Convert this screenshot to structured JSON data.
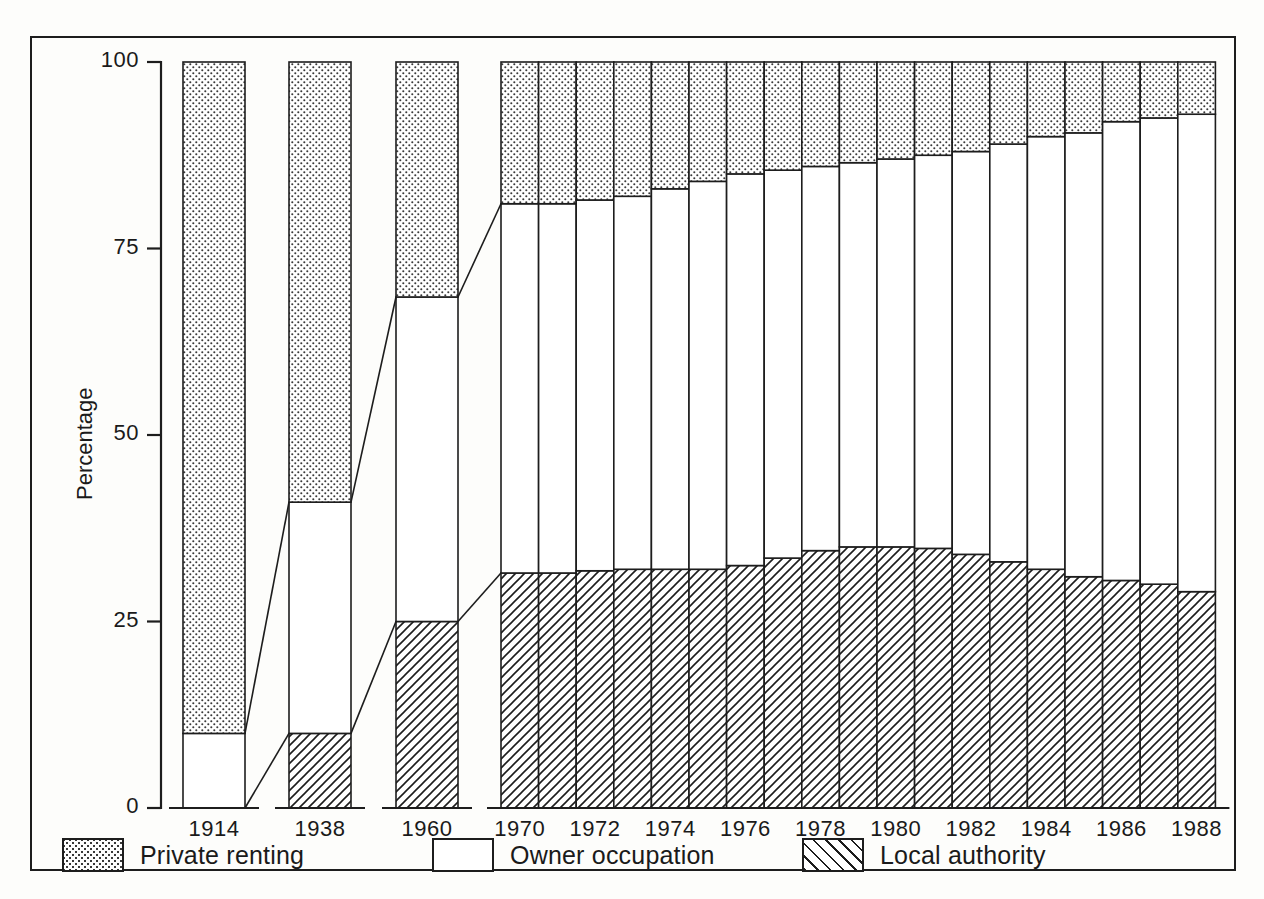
{
  "figure": {
    "frame": true,
    "top_bleed_text": "",
    "ylabel": "Percentage"
  },
  "axis": {
    "y_ticks": [
      "0",
      "25",
      "50",
      "75",
      "100"
    ],
    "x_tick_labels": [
      "1914",
      "1938",
      "1960",
      "1970",
      "1972",
      "1974",
      "1976",
      "1978",
      "1980",
      "1982",
      "1984",
      "1986",
      "1988"
    ]
  },
  "legend": {
    "items": [
      {
        "label": "Private renting",
        "pattern": "dots"
      },
      {
        "label": "Owner occupation",
        "pattern": "plain"
      },
      {
        "label": "Local authority",
        "pattern": "hatch"
      }
    ]
  },
  "chart_data": {
    "type": "bar",
    "title": "",
    "subtitle": "",
    "xlabel": "",
    "ylabel": "Percentage",
    "ylim": [
      0,
      100
    ],
    "grid": false,
    "stacked": true,
    "stack_total": 100,
    "legend_position": "bottom",
    "annotations": [
      "connector lines join 1914-1938-1960-1970 segment boundaries"
    ],
    "categories": [
      "1914",
      "1938",
      "1960",
      "1970",
      "1971",
      "1972",
      "1973",
      "1974",
      "1975",
      "1976",
      "1977",
      "1978",
      "1979",
      "1980",
      "1981",
      "1982",
      "1983",
      "1984",
      "1985",
      "1986",
      "1987",
      "1988"
    ],
    "tick_categories": [
      "1914",
      "1938",
      "1960",
      "1970",
      "1972",
      "1974",
      "1976",
      "1978",
      "1980",
      "1982",
      "1984",
      "1986",
      "1988"
    ],
    "series": [
      {
        "name": "Local authority",
        "pattern": "hatch",
        "values": [
          0,
          10,
          25,
          31.5,
          31.5,
          31.8,
          32,
          32,
          32,
          32.5,
          33.5,
          34.5,
          35,
          35,
          34.8,
          34,
          33,
          32,
          31,
          30.5,
          30,
          29
        ]
      },
      {
        "name": "Owner occupation",
        "pattern": "plain",
        "values": [
          10,
          31,
          43.5,
          49.5,
          49.5,
          49.7,
          50,
          51,
          52,
          52.5,
          52,
          51.5,
          51.5,
          52,
          52.7,
          54,
          56,
          58,
          59.5,
          61.5,
          62.5,
          64
        ]
      },
      {
        "name": "Private renting",
        "pattern": "dots",
        "values": [
          90,
          59,
          31.5,
          19,
          19,
          18.5,
          18,
          17,
          16,
          15,
          14.5,
          14,
          13.5,
          13,
          12.5,
          12,
          11,
          10,
          9.5,
          8,
          7.5,
          7
        ]
      }
    ],
    "cumulative_boundaries": {
      "local_authority_top": [
        0,
        10,
        25,
        31.5,
        31.5,
        31.8,
        32,
        32,
        32,
        32.5,
        33.5,
        34.5,
        35,
        35,
        34.8,
        34,
        33,
        32,
        31,
        30.5,
        30,
        29
      ],
      "owner_occupation_top": [
        10,
        41,
        68.5,
        81,
        81,
        81.5,
        82,
        83,
        84,
        85,
        85.5,
        86,
        86.5,
        87,
        87.5,
        88,
        89,
        90,
        90.5,
        92,
        92.5,
        93
      ]
    }
  },
  "colors": {
    "ink": "#1d1d1d",
    "paper": "#fdfdfb",
    "dot_fill": "#e6e4e0"
  }
}
